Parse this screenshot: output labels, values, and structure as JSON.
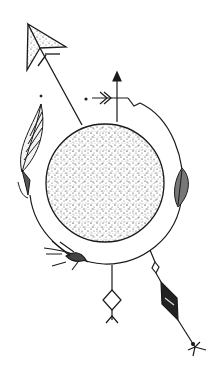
{
  "illustration": {
    "description": "Ink line drawing: stippled moon/sphere with a surrounding ring, arrows and feathers",
    "colors": {
      "ink": "#1a1a1a",
      "background": "#ffffff",
      "stipple": "#3a3a3a"
    },
    "elements": [
      "paper-plane-arrow",
      "stippled-sphere",
      "orbit-ring",
      "up-arrow",
      "left-feather",
      "right-feather",
      "wheat-sprig",
      "diamond-rune-pendant",
      "diamond-arrow-pendant"
    ]
  }
}
